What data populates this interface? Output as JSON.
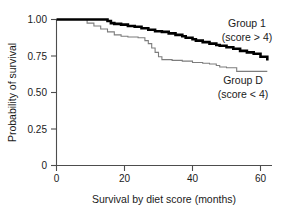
{
  "chart_data": {
    "type": "line",
    "subtype": "kaplan-meier-step",
    "title": "",
    "xlabel": "Survival by diet score (months)",
    "ylabel": "Probability of survival",
    "xlim": [
      0,
      64
    ],
    "ylim": [
      0,
      1.0
    ],
    "xticks": [
      0,
      20,
      40,
      60
    ],
    "xtick_labels": [
      "0",
      "20",
      "40",
      "60"
    ],
    "yticks": [
      0,
      0.25,
      0.5,
      0.75,
      1.0
    ],
    "ytick_labels": [
      "0",
      "0.25",
      "0.50",
      "0.75",
      "1.00"
    ],
    "grid": false,
    "legend_position": "inside-right",
    "series": [
      {
        "name": "Group 1",
        "condition": "score > 4",
        "color": "#000000",
        "line_width": 2.6,
        "x": [
          0,
          6,
          12,
          15,
          16,
          17,
          19,
          21,
          23,
          25,
          27,
          29,
          31,
          33,
          35,
          37,
          38,
          40,
          41,
          43,
          45,
          47,
          48,
          50,
          52,
          54,
          56,
          58,
          60,
          62
        ],
        "y": [
          1.0,
          1.0,
          1.0,
          0.99,
          0.975,
          0.97,
          0.965,
          0.955,
          0.95,
          0.94,
          0.93,
          0.92,
          0.915,
          0.905,
          0.895,
          0.885,
          0.875,
          0.865,
          0.855,
          0.845,
          0.835,
          0.825,
          0.82,
          0.81,
          0.8,
          0.785,
          0.775,
          0.765,
          0.745,
          0.72
        ]
      },
      {
        "name": "Group D",
        "condition": "score < 4",
        "color": "#7d7d7d",
        "line_width": 1.1,
        "x": [
          0,
          7,
          9,
          11,
          13,
          15,
          17,
          19,
          21,
          24,
          26,
          27,
          28,
          29,
          30,
          31,
          34,
          37,
          40,
          43,
          45,
          47,
          48,
          50,
          53,
          62
        ],
        "y": [
          1.0,
          1.0,
          0.975,
          0.955,
          0.935,
          0.915,
          0.895,
          0.885,
          0.88,
          0.875,
          0.855,
          0.835,
          0.805,
          0.775,
          0.745,
          0.725,
          0.72,
          0.715,
          0.705,
          0.7,
          0.695,
          0.685,
          0.675,
          0.67,
          0.645,
          0.645
        ]
      }
    ],
    "annotations": [
      {
        "id": "group1-name",
        "text": "Group 1",
        "x_px": 247,
        "y_px": 27
      },
      {
        "id": "group1-cond",
        "text": "(score > 4)",
        "x_px": 247,
        "y_px": 41
      },
      {
        "id": "groupd-name",
        "text": "Group D",
        "x_px": 243,
        "y_px": 84
      },
      {
        "id": "groupd-cond",
        "text": "(score < 4)",
        "x_px": 243,
        "y_px": 98
      }
    ]
  },
  "axes": {
    "x_title": "Survival by diet score (months)",
    "y_title": "Probability of survival",
    "x_tick_labels": [
      "0",
      "20",
      "40",
      "60"
    ],
    "y_tick_labels": [
      "1.00",
      "0.75",
      "0.50",
      "0.25",
      "0"
    ]
  },
  "colors": {
    "axis": "#4d4d4d",
    "text": "#1a1a1a",
    "group1_line": "#000000",
    "groupd_line": "#7d7d7d",
    "background": "#ffffff"
  }
}
